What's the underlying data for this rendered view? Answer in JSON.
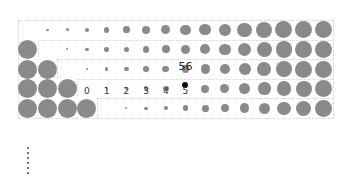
{
  "diagram": {
    "title": "",
    "rows": 5,
    "columns": 16,
    "grid": {
      "left": 18,
      "top": 20,
      "col_pitch": 19.7,
      "row_pitch": 19.6
    },
    "colors": {
      "dot": "#8a8a8a",
      "highlight": "#111111",
      "gridline": "#d2d2d2"
    },
    "row_labels_row": 3,
    "column_labels": [
      "0",
      "1",
      "2",
      "3",
      "4",
      "5"
    ],
    "highlight": {
      "row": 3,
      "col_label": "5",
      "value": "56"
    },
    "continuation": "vertical-ellipsis"
  }
}
